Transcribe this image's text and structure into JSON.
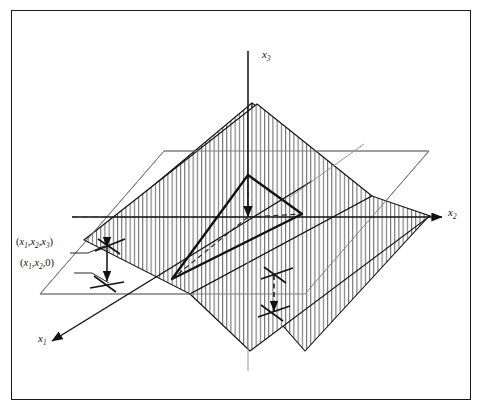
{
  "figure": {
    "border_color": "#1a1a1a",
    "background": "#ffffff",
    "line_color": "#111111",
    "hatch_color": "#555555",
    "guide_color": "#8a8a8a"
  },
  "axes": [
    {
      "name": "x1-axis",
      "label_html": "x<sub>1</sub>",
      "label_text": "x1",
      "direction": "down-left",
      "arrow": true
    },
    {
      "name": "x2-axis",
      "label_html": "x<sub>2</sub>",
      "label_text": "x2",
      "direction": "right",
      "arrow": true
    },
    {
      "name": "x3-axis",
      "label_html": "x<sub>3</sub>",
      "label_text": "x3",
      "direction": "up",
      "arrow": true
    }
  ],
  "point_labels": [
    {
      "name": "point-xyz",
      "text": "(x1,x2,x3)",
      "html": "(<i>x</i><sub>1</sub>,<i>x</i><sub>2</sub>,<i>x</i><sub>3</sub>)"
    },
    {
      "name": "point-xy0",
      "text": "(x1,x2,0)",
      "html": "(<i>x</i><sub>1</sub>,<i>x</i><sub>2</sub>,0)"
    }
  ],
  "chart_data": {
    "type": "diagram",
    "elements": [
      "slanted hatched plane (graph surface)",
      "horizontal hatched plane (x1-x2 coordinate plane)",
      "bold triangle at origin showing height",
      "dashed projection lines",
      "double-headed vertical arrows marking vertical distance"
    ],
    "axis_labels": [
      "x1",
      "x2",
      "x3"
    ],
    "annotations": [
      "(x1,x2,x3)",
      "(x1,x2,0)"
    ]
  }
}
